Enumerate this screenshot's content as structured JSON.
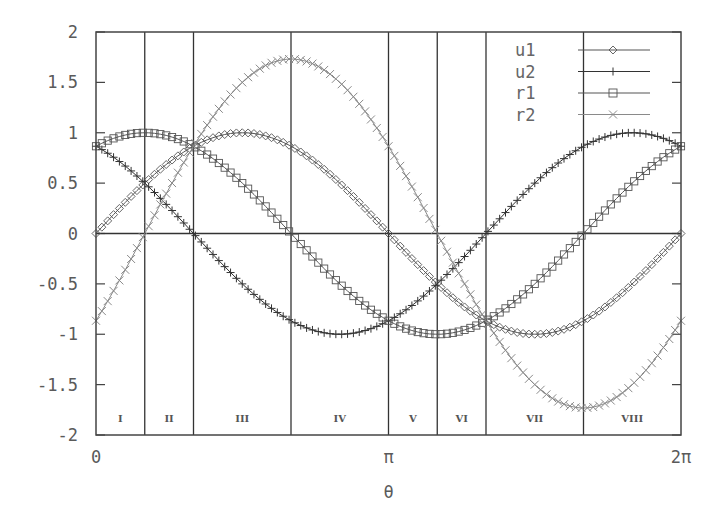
{
  "chart_data": {
    "type": "line",
    "title": "",
    "xlabel": "θ",
    "ylabel": "",
    "xlim": [
      0,
      6.283185
    ],
    "ylim": [
      -2,
      2
    ],
    "grid": false,
    "legend_position": "upper-right-inside",
    "x_ticks": [
      {
        "value": 0,
        "label": "0"
      },
      {
        "value": 3.141593,
        "label": "π"
      },
      {
        "value": 6.283185,
        "label": "2π"
      }
    ],
    "y_ticks": [
      {
        "value": 2,
        "label": "2"
      },
      {
        "value": 1.5,
        "label": "1.5"
      },
      {
        "value": 1,
        "label": "1"
      },
      {
        "value": 0.5,
        "label": "0.5"
      },
      {
        "value": 0,
        "label": "0"
      },
      {
        "value": -0.5,
        "label": "-0.5"
      },
      {
        "value": -1,
        "label": "-1"
      },
      {
        "value": -1.5,
        "label": "-1.5"
      },
      {
        "value": -2,
        "label": "-2"
      }
    ],
    "zero_line": true,
    "region_dividers": [
      0.523599,
      1.047198,
      2.094395,
      3.141593,
      3.665191,
      4.18879,
      5.235988
    ],
    "regions": [
      {
        "label": "I",
        "x": 0.261799
      },
      {
        "label": "II",
        "x": 0.785398
      },
      {
        "label": "III",
        "x": 1.570796
      },
      {
        "label": "IV",
        "x": 2.617994
      },
      {
        "label": "V",
        "x": 3.403392
      },
      {
        "label": "VI",
        "x": 3.926991
      },
      {
        "label": "VII",
        "x": 4.712389
      },
      {
        "label": "VIII",
        "x": 5.759587
      }
    ],
    "series": [
      {
        "name": "u1",
        "marker": "diamond",
        "color": "#555555",
        "formula": "sin(θ)",
        "x": [
          0,
          0.5236,
          1.0472,
          1.5708,
          2.0944,
          2.618,
          3.1416,
          3.6652,
          4.1888,
          4.7124,
          5.236,
          5.7596,
          6.2832
        ],
        "values": [
          0,
          0.5,
          0.866,
          1,
          0.866,
          0.5,
          0,
          -0.5,
          -0.866,
          -1,
          -0.866,
          -0.5,
          0
        ]
      },
      {
        "name": "u2",
        "marker": "plus",
        "color": "#333333",
        "formula": "cos(θ+π/6)",
        "x": [
          0,
          0.5236,
          1.0472,
          1.5708,
          2.0944,
          2.618,
          3.1416,
          3.6652,
          4.1888,
          4.7124,
          5.236,
          5.7596,
          6.2832
        ],
        "values": [
          0.866,
          0.5,
          0,
          -0.5,
          -0.866,
          -1,
          -0.866,
          -0.5,
          0,
          0.5,
          0.866,
          1,
          0.866
        ]
      },
      {
        "name": "r1",
        "marker": "square",
        "color": "#555555",
        "formula": "cos(θ-π/6)",
        "x": [
          0,
          0.5236,
          1.0472,
          1.5708,
          2.0944,
          2.618,
          3.1416,
          3.6652,
          4.1888,
          4.7124,
          5.236,
          5.7596,
          6.2832
        ],
        "values": [
          0.866,
          1,
          0.866,
          0.5,
          0,
          -0.5,
          -0.866,
          -1,
          -0.866,
          -0.5,
          0,
          0.5,
          0.866
        ]
      },
      {
        "name": "r2",
        "marker": "cross",
        "color": "#8a8a8a",
        "formula": "√3·sin(θ-π/6)",
        "x": [
          0,
          0.5236,
          1.0472,
          1.5708,
          2.0944,
          2.618,
          3.1416,
          3.6652,
          4.1888,
          4.7124,
          5.236,
          5.7596,
          6.2832
        ],
        "values": [
          -0.866,
          0,
          0.866,
          1.5,
          1.732,
          1.5,
          0.866,
          0,
          -0.866,
          -1.5,
          -1.732,
          -1.5,
          -0.866
        ]
      }
    ]
  },
  "legend": {
    "items": [
      {
        "label": "u1",
        "marker": "diamond"
      },
      {
        "label": "u2",
        "marker": "plus"
      },
      {
        "label": "r1",
        "marker": "square"
      },
      {
        "label": "r2",
        "marker": "cross"
      }
    ]
  },
  "axes": {
    "x_title": "θ"
  }
}
